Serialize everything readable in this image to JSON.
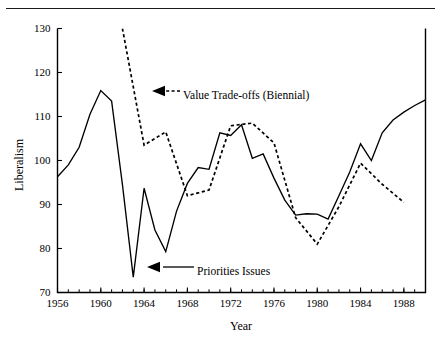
{
  "figure": {
    "has_top_rule": true,
    "background": "#ffffff",
    "ink": "#000000"
  },
  "chart_data": {
    "type": "line",
    "title": "",
    "xlabel": "Year",
    "ylabel": "Liberalism",
    "xlim": [
      1956,
      1990
    ],
    "ylim": [
      70,
      130
    ],
    "yticks": [
      70,
      80,
      90,
      100,
      110,
      120,
      130
    ],
    "ytick_labels": [
      "70",
      "80",
      "90",
      "100",
      "110",
      "120",
      "130"
    ],
    "xticks": [
      1956,
      1960,
      1964,
      1968,
      1972,
      1976,
      1980,
      1984,
      1988
    ],
    "xtick_labels": [
      "1956",
      "1960",
      "1964",
      "1968",
      "1972",
      "1976",
      "1980",
      "1984",
      "1988"
    ],
    "x_minor_tick_step": 1,
    "grid": false,
    "legend": "inline-annotations",
    "series": [
      {
        "name": "Priorities Issues",
        "style": "solid",
        "x": [
          1956,
          1957,
          1958,
          1959,
          1960,
          1961,
          1962,
          1963,
          1964,
          1965,
          1966,
          1967,
          1968,
          1969,
          1970,
          1971,
          1972,
          1973,
          1974,
          1975,
          1976,
          1977,
          1978,
          1979,
          1980,
          1981,
          1982,
          1983,
          1984,
          1985,
          1986,
          1987,
          1988,
          1989,
          1990
        ],
        "values": [
          96.3,
          99.0,
          103.0,
          110.5,
          115.9,
          113.5,
          94.5,
          73.5,
          93.7,
          84.2,
          79.3,
          88.5,
          94.8,
          98.4,
          98.0,
          106.3,
          105.7,
          108.1,
          100.5,
          101.5,
          96.0,
          91.0,
          87.6,
          87.9,
          87.8,
          86.7,
          92.0,
          97.4,
          103.8,
          100.0,
          106.3,
          109.2,
          111.0,
          112.5,
          113.8
        ]
      },
      {
        "name": "Value Trade-offs (Biennial)",
        "style": "dashed",
        "biennial": true,
        "x": [
          1962,
          1964,
          1966,
          1968,
          1970,
          1972,
          1974,
          1976,
          1978,
          1980,
          1982,
          1984,
          1986,
          1988
        ],
        "values": [
          130.0,
          103.5,
          106.5,
          92.0,
          93.3,
          107.9,
          108.5,
          104.0,
          87.0,
          81.0,
          89.5,
          99.4,
          94.6,
          90.5
        ],
        "clipped_at_top": true,
        "note": "First plotted point is clipped by the upper axis limit of 130"
      }
    ],
    "annotations": [
      {
        "id": "value-tradeoffs",
        "label": "Value Trade-offs (Biennial)",
        "style": "dashed",
        "text_x": 183,
        "text_y": 95,
        "arrow_tip_x": 152,
        "arrow_tip_y": 91,
        "leader_from_x": 180,
        "leader_to_x": 166
      },
      {
        "id": "priorities-issues",
        "label": "Priorities Issues",
        "style": "solid",
        "text_x": 197,
        "text_y": 271,
        "arrow_tip_x": 147,
        "arrow_tip_y": 267,
        "leader_from_x": 194,
        "leader_to_x": 163
      }
    ]
  }
}
